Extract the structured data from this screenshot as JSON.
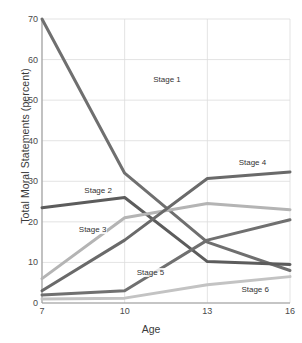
{
  "chart_data": {
    "type": "line",
    "title": "",
    "xlabel": "Age",
    "ylabel": "Total Moral Statements (percent)",
    "x": [
      7,
      10,
      13,
      16
    ],
    "xticks": [
      "7",
      "10",
      "13",
      "16"
    ],
    "yticks": [
      "0",
      "10",
      "20",
      "30",
      "40",
      "50",
      "60",
      "70"
    ],
    "xlim": [
      7,
      16
    ],
    "ylim": [
      0,
      70
    ],
    "grid": true,
    "legend_position": "inline-annotations",
    "series": [
      {
        "name": "Stage 1",
        "values": [
          70,
          32,
          15,
          8
        ],
        "color": "#6f6f6f",
        "label_x": 11.0,
        "label_y": 55
      },
      {
        "name": "Stage 2",
        "values": [
          23.5,
          26,
          10.2,
          9.5
        ],
        "color": "#5c5c5c",
        "label_x": 8.5,
        "label_y": 27.5
      },
      {
        "name": "Stage 3",
        "values": [
          6,
          21,
          24.5,
          23
        ],
        "color": "#b4b4b4",
        "label_x": 8.3,
        "label_y": 18
      },
      {
        "name": "Stage 4",
        "values": [
          3,
          15.5,
          30.7,
          32.3
        ],
        "color": "#6a6a6a",
        "label_x": 14.1,
        "label_y": 34.5
      },
      {
        "name": "Stage 5",
        "values": [
          2,
          3,
          15.5,
          20.5
        ],
        "color": "#707070",
        "label_x": 10.4,
        "label_y": 7.5
      },
      {
        "name": "Stage 6",
        "values": [
          1,
          1.2,
          4.5,
          6.5
        ],
        "color": "#c3c3c3",
        "label_x": 14.2,
        "label_y": 3.2
      }
    ]
  }
}
